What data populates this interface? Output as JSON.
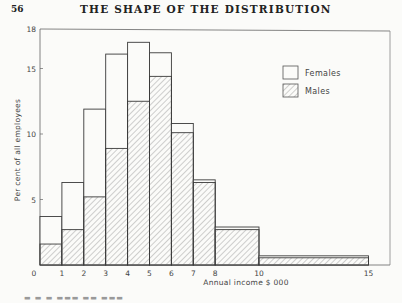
{
  "page": {
    "number": "56",
    "running_head": "THE SHAPE OF THE DISTRIBUTION",
    "caption_partial": "FIG. 3.1 Wife's..."
  },
  "chart_data": {
    "type": "bar",
    "subtype": "stacked-histogram",
    "title": "",
    "xlabel": "Annual income $ 000",
    "ylabel": "Per cent of all employees",
    "xlim": [
      0,
      15
    ],
    "ylim": [
      0,
      18
    ],
    "x_ticks": [
      "0",
      "1",
      "2",
      "3",
      "4",
      "5",
      "6",
      "7",
      "8",
      "10",
      "15"
    ],
    "y_ticks": [
      "5",
      "10",
      "15",
      "18"
    ],
    "bins": [
      [
        0,
        1
      ],
      [
        1,
        2
      ],
      [
        2,
        3
      ],
      [
        3,
        4
      ],
      [
        4,
        5
      ],
      [
        5,
        6
      ],
      [
        6,
        7
      ],
      [
        7,
        8
      ],
      [
        8,
        10
      ],
      [
        10,
        15
      ]
    ],
    "categories": [
      "0-1",
      "1-2",
      "2-3",
      "3-4",
      "4-5",
      "5-6",
      "6-7",
      "7-8",
      "8-10",
      "10-15"
    ],
    "series": [
      {
        "name": "Males",
        "pattern": "hatched",
        "values": [
          1.6,
          2.7,
          5.2,
          8.9,
          12.5,
          14.4,
          10.1,
          6.3,
          2.7,
          0.55
        ]
      },
      {
        "name": "Females",
        "pattern": "open",
        "values": [
          2.1,
          3.6,
          6.7,
          7.2,
          4.5,
          1.8,
          0.7,
          0.2,
          0.2,
          0.15
        ]
      }
    ],
    "totals": [
      3.7,
      6.3,
      11.9,
      16.1,
      17.0,
      16.2,
      10.8,
      6.5,
      2.9,
      0.7
    ],
    "legend": {
      "position": "upper right",
      "entries": [
        "Females",
        "Males"
      ]
    },
    "grid": false,
    "colors": {
      "line": "#3a3a3a",
      "hatch": "#8a8a8a",
      "background": "#fbfbf9"
    }
  }
}
